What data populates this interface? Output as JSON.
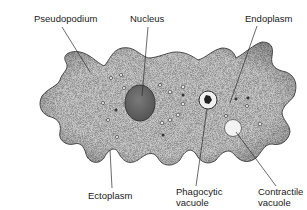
{
  "labels": {
    "pseudopodium": "Pseudopodium",
    "nucleus": "Nucleus",
    "endoplasm": "Endoplasm",
    "ectoplasm": "Ectoplasm",
    "phagocytic_vacuole": [
      "Phagocytic",
      "vacuole"
    ],
    "contractile_vacuole": [
      "Contractile",
      "vacuole"
    ]
  },
  "colors": {
    "cell_fill": "#c8c8c8",
    "cell_edge": "#3a3a3a",
    "nucleus_fill": "#6e6e6e",
    "contractile_fill": "#f2f2f2",
    "leader_line": "#2a2a2a",
    "text": "#1a1a1a"
  }
}
